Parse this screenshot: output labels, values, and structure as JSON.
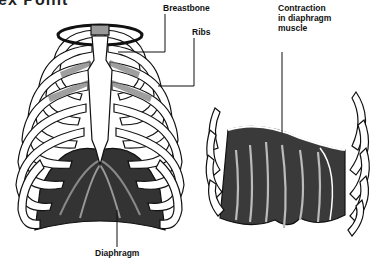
{
  "title_fragment": "ex Point",
  "figure": {
    "left_panel": {
      "description": "Front view of rib cage with diaphragm",
      "labels": {
        "breastbone": "Breastbone",
        "ribs": "Ribs",
        "diaphragm": "Diaphragm"
      }
    },
    "right_panel": {
      "description": "Diaphragm muscle contracting",
      "label_lines": [
        "Contraction",
        "in diaphragm",
        "muscle"
      ]
    }
  },
  "colors": {
    "ink": "#111111",
    "bone": "#ffffff",
    "muscle_dark": "#2a2a2a",
    "muscle_mid": "#777777"
  }
}
